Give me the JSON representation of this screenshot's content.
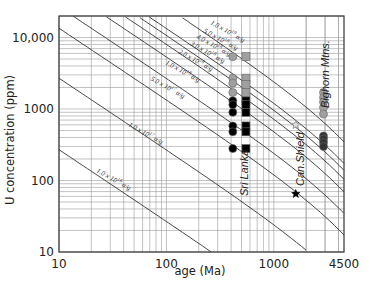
{
  "chart_data": {
    "type": "scatter",
    "title": "",
    "xlabel": "age (Ma)",
    "ylabel": "U concentration (ppm)",
    "xscale": "log",
    "yscale": "log",
    "xlim": [
      10,
      4500
    ],
    "ylim": [
      10,
      20000
    ],
    "x_ticks": [
      {
        "value": 10,
        "label": "10"
      },
      {
        "value": 100,
        "label": "100"
      },
      {
        "value": 1000,
        "label": "1000"
      },
      {
        "value": 4500,
        "label": "4500"
      }
    ],
    "y_ticks": [
      {
        "value": 10,
        "label": "10"
      },
      {
        "value": 100,
        "label": "100"
      },
      {
        "value": 1000,
        "label": "1000"
      },
      {
        "value": 10000,
        "label": "10,000"
      }
    ],
    "grid": true,
    "iso_dose_lines": [
      {
        "dose": 1e+16,
        "label": "1.0 x 10^16 α/g"
      },
      {
        "dose": 1e+17,
        "label": "1.0 x 10^17 α/g"
      },
      {
        "dose": 5e+17,
        "label": "5.0 x 10^17 α/g"
      },
      {
        "dose": 1e+18,
        "label": "1.0 x 10^18 α/g"
      },
      {
        "dose": 2e+18,
        "label": "2.0 x 10^18 α/g"
      },
      {
        "dose": 3e+18,
        "label": "3.0 x 10^18 α/g"
      },
      {
        "dose": 4e+18,
        "label": "4.0 x 10^18 α/g"
      },
      {
        "dose": 5e+18,
        "label": "5.0 x 10^18 α/g"
      },
      {
        "dose": 1e+19,
        "label": "1.0 x 10^19 α/g"
      }
    ],
    "annotations": [
      "Sri Lanka",
      "Can.Shield",
      "Bighorn Mtns."
    ],
    "series": [
      {
        "name": "Sri Lanka (grey circles)",
        "marker": "circle",
        "color": "#a0a0a0",
        "points": [
          [
            415,
            5400
          ],
          [
            415,
            2700
          ],
          [
            415,
            2300
          ],
          [
            415,
            1700
          ]
        ]
      },
      {
        "name": "Sri Lanka (grey squares)",
        "marker": "square",
        "color": "#a0a0a0",
        "points": [
          [
            550,
            5400
          ],
          [
            550,
            2700
          ],
          [
            550,
            2200
          ],
          [
            550,
            1700
          ]
        ]
      },
      {
        "name": "Sri Lanka (black circles)",
        "marker": "circle",
        "color": "#000000",
        "points": [
          [
            415,
            1300
          ],
          [
            415,
            1150
          ],
          [
            415,
            900
          ],
          [
            415,
            580
          ],
          [
            415,
            480
          ],
          [
            415,
            280
          ]
        ]
      },
      {
        "name": "Sri Lanka (black squares)",
        "marker": "square",
        "color": "#000000",
        "points": [
          [
            550,
            1300
          ],
          [
            550,
            1150
          ],
          [
            550,
            900
          ],
          [
            550,
            580
          ],
          [
            550,
            480
          ],
          [
            550,
            280
          ]
        ]
      },
      {
        "name": "Can. Shield (open star)",
        "marker": "star-open",
        "color": "#888888",
        "points": [
          [
            1600,
            600
          ]
        ]
      },
      {
        "name": "Can. Shield (black star)",
        "marker": "star",
        "color": "#000000",
        "points": [
          [
            1600,
            65
          ]
        ]
      },
      {
        "name": "Bighorn Mtns. (grey circles)",
        "marker": "circle",
        "color": "#a0a0a0",
        "points": [
          [
            2900,
            1700
          ],
          [
            2900,
            1450
          ],
          [
            2900,
            1250
          ],
          [
            2900,
            1050
          ],
          [
            2900,
            850
          ]
        ]
      },
      {
        "name": "Bighorn Mtns. (dark circles)",
        "marker": "circle",
        "color": "#333333",
        "points": [
          [
            2900,
            420
          ],
          [
            2900,
            380
          ],
          [
            2900,
            340
          ],
          [
            2900,
            300
          ]
        ]
      }
    ],
    "legend": "none"
  }
}
